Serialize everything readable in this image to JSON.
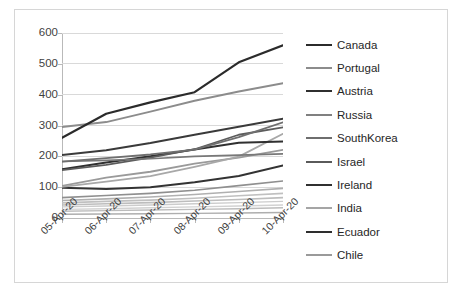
{
  "chart_data": {
    "type": "line",
    "title": "",
    "xlabel": "",
    "ylabel": "",
    "x": [
      "05-Apr-20",
      "06-Apr-20",
      "07-Apr-20",
      "08-Apr-20",
      "09-Apr-20",
      "10-Apr-20"
    ],
    "ylim": [
      0,
      600
    ],
    "yticks": [
      0,
      100,
      200,
      300,
      400,
      500,
      600
    ],
    "ytick_labels": [
      "0",
      "100",
      "200",
      "300",
      "400",
      "500",
      "600"
    ],
    "grid": "horizontal",
    "legend_position": "right",
    "series": [
      {
        "name": "Canada",
        "color": "#2b2b2b",
        "width": 2.2,
        "values": [
          260,
          338,
          375,
          408,
          505,
          560
        ]
      },
      {
        "name": "Portugal",
        "color": "#8c8c8c",
        "width": 2.0,
        "values": [
          295,
          311,
          345,
          380,
          410,
          437
        ]
      },
      {
        "name": "Austria",
        "color": "#3a3a3a",
        "width": 2.0,
        "values": [
          204,
          220,
          243,
          270,
          296,
          322
        ]
      },
      {
        "name": "Russia",
        "color": "#6f6f6f",
        "width": 1.8,
        "values": [
          183,
          194,
          206,
          222,
          262,
          310
        ]
      },
      {
        "name": "SouthKorea",
        "color": "#787878",
        "width": 1.6,
        "values": [
          183,
          187,
          192,
          200,
          204,
          208
        ]
      },
      {
        "name": "Israel",
        "color": "#5c5c5c",
        "width": 1.8,
        "values": [
          155,
          172,
          196,
          223,
          270,
          294
        ]
      },
      {
        "name": "Ireland",
        "color": "#303030",
        "width": 2.0,
        "values": [
          158,
          180,
          200,
          222,
          244,
          248
        ]
      },
      {
        "name": "India",
        "color": "#a8a8a8",
        "width": 1.8,
        "values": [
          101,
          118,
          136,
          166,
          199,
          273
        ]
      },
      {
        "name": "Ecuador",
        "color": "#333333",
        "width": 2.0,
        "values": [
          98,
          94,
          100,
          116,
          136,
          170
        ]
      },
      {
        "name": "Chile",
        "color": "#9a9a9a",
        "width": 1.8,
        "values": [
          104,
          131,
          150,
          176,
          196,
          221
        ]
      },
      {
        "name": "series-11",
        "color": "#8f8f8f",
        "width": 1.6,
        "values": [
          66,
          73,
          80,
          90,
          105,
          120
        ]
      },
      {
        "name": "series-12",
        "color": "#b0b0b0",
        "width": 1.6,
        "values": [
          57,
          62,
          68,
          76,
          86,
          96
        ]
      },
      {
        "name": "series-13",
        "color": "#c0c0c0",
        "width": 1.6,
        "values": [
          49,
          54,
          58,
          64,
          72,
          80
        ]
      },
      {
        "name": "series-14",
        "color": "#bdbdbd",
        "width": 1.6,
        "values": [
          42,
          46,
          50,
          55,
          60,
          66
        ]
      },
      {
        "name": "series-15",
        "color": "#cccccc",
        "width": 1.4,
        "values": [
          36,
          39,
          42,
          46,
          50,
          54
        ]
      },
      {
        "name": "series-16",
        "color": "#d2d2d2",
        "width": 1.4,
        "values": [
          28,
          30,
          33,
          36,
          39,
          42
        ]
      },
      {
        "name": "series-17",
        "color": "#bcbcbc",
        "width": 1.4,
        "values": [
          22,
          24,
          26,
          28,
          30,
          33
        ]
      },
      {
        "name": "series-18",
        "color": "#aeaeae",
        "width": 1.4,
        "values": [
          12,
          13,
          14,
          15,
          16,
          18
        ]
      }
    ]
  },
  "legend": {
    "items": [
      {
        "label": "Canada",
        "color": "#2b2b2b",
        "width": 2.6
      },
      {
        "label": "Portugal",
        "color": "#8c8c8c",
        "width": 2.2
      },
      {
        "label": "Austria",
        "color": "#2f2f2f",
        "width": 2.8
      },
      {
        "label": "Russia",
        "color": "#808080",
        "width": 2.2
      },
      {
        "label": "SouthKorea",
        "color": "#6e6e6e",
        "width": 2.0
      },
      {
        "label": "Israel",
        "color": "#5a5a5a",
        "width": 2.0
      },
      {
        "label": "Ireland",
        "color": "#303030",
        "width": 2.6
      },
      {
        "label": "India",
        "color": "#a5a5a5",
        "width": 2.0
      },
      {
        "label": "Ecuador",
        "color": "#2e2e2e",
        "width": 2.8
      },
      {
        "label": "Chile",
        "color": "#9a9a9a",
        "width": 2.2
      }
    ]
  },
  "axes": {
    "y_tick_labels": [
      "600",
      "500",
      "400",
      "300",
      "200",
      "100",
      "0"
    ],
    "x_tick_labels": [
      "05-Apr-20",
      "06-Apr-20",
      "07-Apr-20",
      "08-Apr-20",
      "09-Apr-20",
      "10-Apr-20"
    ],
    "gridline_color": "#d9d9d9",
    "axis_color": "#b9b9b9",
    "label_color": "#3f3f3f"
  }
}
